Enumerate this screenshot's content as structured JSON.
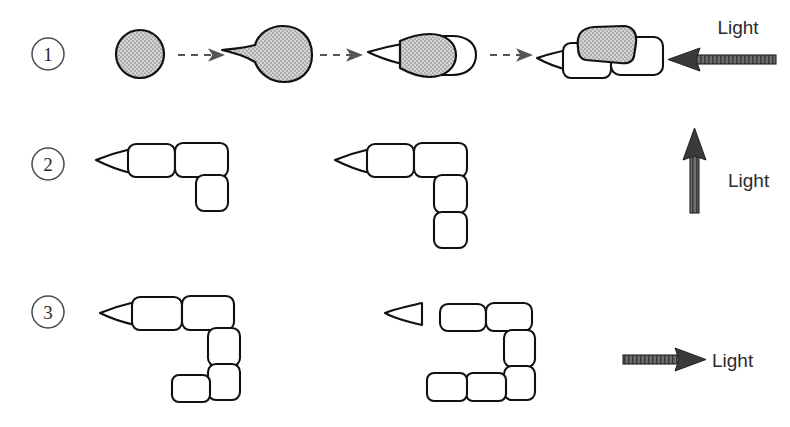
{
  "figure": {
    "background_color": "#ffffff",
    "ink_color": "#111111",
    "shade_color": "#a8a8a8",
    "arrow_color": "#555555"
  },
  "rows": [
    {
      "id": "row-1",
      "label": "1",
      "light_label": "Light",
      "light_direction": "left",
      "description": "Germination sequence: spore swells, grows a rhizoid tip, then divides into cells that bend away from the light source",
      "stages": [
        {
          "id": "stage-1",
          "name": "spore",
          "shaded": true,
          "cells": 0
        },
        {
          "id": "stage-2",
          "name": "germinating-spore-with-tip",
          "shaded": true,
          "cells": 0
        },
        {
          "id": "stage-3",
          "name": "two-celled-germling",
          "shaded": true,
          "cells": 1
        },
        {
          "id": "stage-4",
          "name": "branched-germling",
          "shaded": true,
          "cells": 2
        }
      ],
      "connector": "dashed-arrow",
      "connector_count": 3
    },
    {
      "id": "row-2",
      "label": "2",
      "light_label": "Light",
      "light_direction": "up",
      "description": "Filaments grow horizontally then turn downward, away from the upward light",
      "figures": [
        {
          "id": "row2-fig-1",
          "horizontal_cells": 2,
          "vertical_cells": 1,
          "foot_cells": 0
        },
        {
          "id": "row2-fig-2",
          "horizontal_cells": 2,
          "vertical_cells": 2,
          "foot_cells": 0
        }
      ]
    },
    {
      "id": "row-3",
      "label": "3",
      "light_label": "Light",
      "light_direction": "right",
      "description": "Filaments grow horizontally, turn downward, then turn back toward the left away from the light",
      "figures": [
        {
          "id": "row3-fig-1",
          "horizontal_cells": 2,
          "vertical_cells": 2,
          "foot_cells": 1
        },
        {
          "id": "row3-fig-2",
          "horizontal_cells": 2,
          "vertical_cells": 2,
          "foot_cells": 2
        }
      ]
    }
  ]
}
